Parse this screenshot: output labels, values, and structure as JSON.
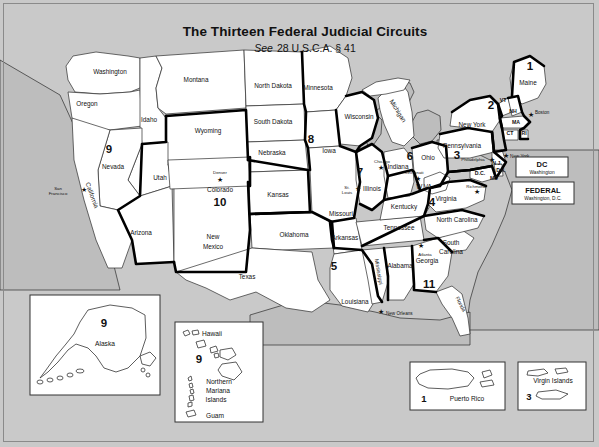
{
  "header": {
    "title": "The Thirteen Federal Judicial Circuits",
    "subtitle_italic": "See",
    "subtitle_rest": "28 U.S.C.A. § 41"
  },
  "colors": {
    "background": "#c9c9c9",
    "land": "#ffffff",
    "water": "#bdbdbd",
    "border": "#2b2b2b",
    "circuit_boundary": "#000000"
  },
  "states": [
    {
      "name": "Washington",
      "x": 110,
      "y": 74
    },
    {
      "name": "Oregon",
      "x": 87,
      "y": 106
    },
    {
      "name": "Idaho",
      "x": 149,
      "y": 122
    },
    {
      "name": "Montana",
      "x": 196,
      "y": 82
    },
    {
      "name": "Wyoming",
      "x": 208,
      "y": 133
    },
    {
      "name": "Nevada",
      "x": 113,
      "y": 169
    },
    {
      "name": "Utah",
      "x": 160,
      "y": 180
    },
    {
      "name": "California",
      "x": 90,
      "y": 196
    },
    {
      "name": "Arizona",
      "x": 141,
      "y": 235
    },
    {
      "name": "New",
      "x": 213,
      "y": 239
    },
    {
      "name": "Mexico",
      "x": 213,
      "y": 249
    },
    {
      "name": "Colorado",
      "x": 220,
      "y": 192
    },
    {
      "name": "North Dakota",
      "x": 273,
      "y": 88
    },
    {
      "name": "South Dakota",
      "x": 273,
      "y": 124
    },
    {
      "name": "Nebraska",
      "x": 272,
      "y": 155
    },
    {
      "name": "Kansas",
      "x": 278,
      "y": 197
    },
    {
      "name": "Oklahoma",
      "x": 294,
      "y": 237
    },
    {
      "name": "Texas",
      "x": 247,
      "y": 279
    },
    {
      "name": "Minnesota",
      "x": 318,
      "y": 90
    },
    {
      "name": "Iowa",
      "x": 329,
      "y": 153
    },
    {
      "name": "Missouri",
      "x": 341,
      "y": 216
    },
    {
      "name": "Arkansas",
      "x": 345,
      "y": 240
    },
    {
      "name": "Louisiana",
      "x": 355,
      "y": 304
    },
    {
      "name": "Wisconsin",
      "x": 359,
      "y": 119
    },
    {
      "name": "Illinois",
      "x": 372,
      "y": 191
    },
    {
      "name": "Mississippi",
      "x": 377,
      "y": 272
    },
    {
      "name": "Alabama",
      "x": 400,
      "y": 268
    },
    {
      "name": "Tennessee",
      "x": 399,
      "y": 230
    },
    {
      "name": "Kentucky",
      "x": 404,
      "y": 209
    },
    {
      "name": "Indiana",
      "x": 398,
      "y": 169
    },
    {
      "name": "Ohio",
      "x": 428,
      "y": 160
    },
    {
      "name": "Michigan",
      "x": 396,
      "y": 112
    },
    {
      "name": "Georgia",
      "x": 427,
      "y": 263
    },
    {
      "name": "Florida",
      "x": 459,
      "y": 305
    },
    {
      "name": "South",
      "x": 451,
      "y": 245
    },
    {
      "name": "Carolina",
      "x": 451,
      "y": 254
    },
    {
      "name": "North Carolina",
      "x": 457,
      "y": 222
    },
    {
      "name": "Virginia",
      "x": 446,
      "y": 201
    },
    {
      "name": "W.VA.",
      "x": 425,
      "y": 189
    },
    {
      "name": "Pennsylvania",
      "x": 462,
      "y": 148
    },
    {
      "name": "New York",
      "x": 472,
      "y": 127
    },
    {
      "name": "Maine",
      "x": 528,
      "y": 85
    }
  ],
  "abbr_states": [
    {
      "name": "VT",
      "x": 503,
      "y": 102
    },
    {
      "name": "NH",
      "x": 513,
      "y": 113
    },
    {
      "name": "MA",
      "x": 516,
      "y": 124
    },
    {
      "name": "CT",
      "x": 510,
      "y": 135
    },
    {
      "name": "RI",
      "x": 524,
      "y": 135
    },
    {
      "name": "N.J.",
      "x": 497,
      "y": 165
    },
    {
      "name": "Del.",
      "x": 501,
      "y": 172
    },
    {
      "name": "MD",
      "x": 494,
      "y": 180
    },
    {
      "name": "D.C.",
      "x": 480,
      "y": 175
    }
  ],
  "circuit_numbers": [
    {
      "label": "1",
      "x": 530,
      "y": 70
    },
    {
      "label": "2",
      "x": 491,
      "y": 109
    },
    {
      "label": "3",
      "x": 457,
      "y": 159
    },
    {
      "label": "4",
      "x": 432,
      "y": 206
    },
    {
      "label": "5",
      "x": 334,
      "y": 270
    },
    {
      "label": "6",
      "x": 410,
      "y": 160
    },
    {
      "label": "7",
      "x": 360,
      "y": 176
    },
    {
      "label": "8",
      "x": 311,
      "y": 143
    },
    {
      "label": "9",
      "x": 109,
      "y": 153
    },
    {
      "label": "10",
      "x": 220,
      "y": 206
    },
    {
      "label": "11",
      "x": 429,
      "y": 288
    }
  ],
  "cities": [
    {
      "name": "San",
      "sub": "Francisco",
      "x": 58,
      "y": 192,
      "star_x": 84,
      "star_y": 190
    },
    {
      "name": "Denver",
      "sub": "",
      "x": 220,
      "y": 173,
      "star_x": 220,
      "star_y": 180
    },
    {
      "name": "St.",
      "sub": "Louis",
      "x": 348,
      "y": 190,
      "star_x": 358,
      "star_y": 190
    },
    {
      "name": "Chicago",
      "sub": "",
      "x": 382,
      "y": 162,
      "star_x": 381,
      "star_y": 168
    },
    {
      "name": "Cincinnati",
      "sub": "",
      "x": 415,
      "y": 172,
      "star_x": 418,
      "star_y": 179
    },
    {
      "name": "Atlanta",
      "sub": "",
      "x": 425,
      "y": 253,
      "star_x": 421,
      "star_y": 247
    },
    {
      "name": "New Orleans",
      "sub": "",
      "x": 392,
      "y": 315,
      "star_x": 381,
      "star_y": 312
    },
    {
      "name": "Boston",
      "sub": "",
      "x": 540,
      "y": 116,
      "star_x": 531,
      "star_y": 115
    },
    {
      "name": "New York",
      "sub": "",
      "x": 516,
      "y": 157,
      "star_x": 506,
      "star_y": 156
    },
    {
      "name": "Philadelphia",
      "sub": "",
      "x": 477,
      "y": 161,
      "star_x": 492,
      "star_y": 160
    },
    {
      "name": "Richmond",
      "sub": "",
      "x": 476,
      "y": 186,
      "star_x": 477,
      "star_y": 193
    }
  ],
  "legend_boxes": [
    {
      "title": "DC",
      "subtitle": "Washington",
      "x": 516,
      "y": 157,
      "w": 52,
      "h": 20
    },
    {
      "title": "FEDERAL",
      "subtitle": "Washington, D.C.",
      "x": 512,
      "y": 182,
      "w": 62,
      "h": 22
    }
  ],
  "insets": [
    {
      "name": "alaska",
      "x": 30,
      "y": 295,
      "w": 130,
      "h": 100,
      "labels": [
        {
          "text": "9",
          "x": 104,
          "y": 324,
          "type": "number"
        },
        {
          "text": "Alaska",
          "x": 105,
          "y": 344,
          "type": "name"
        }
      ]
    },
    {
      "name": "hawaii-pacific",
      "x": 175,
      "y": 322,
      "w": 88,
      "h": 100,
      "labels": [
        {
          "text": "Hawaii",
          "x": 212,
          "y": 334,
          "type": "name"
        },
        {
          "text": "9",
          "x": 199,
          "y": 359,
          "type": "number"
        },
        {
          "text": "Northern",
          "x": 219,
          "y": 382,
          "type": "name"
        },
        {
          "text": "Mariana",
          "x": 218,
          "y": 391,
          "type": "name"
        },
        {
          "text": "Islands",
          "x": 216,
          "y": 400,
          "type": "name"
        },
        {
          "text": "Guam",
          "x": 215,
          "y": 416,
          "type": "name"
        }
      ]
    },
    {
      "name": "puerto-rico",
      "x": 410,
      "y": 362,
      "w": 95,
      "h": 48,
      "labels": [
        {
          "text": "1",
          "x": 424,
          "y": 401,
          "type": "number"
        },
        {
          "text": "Puerto Rico",
          "x": 467,
          "y": 400,
          "type": "name"
        }
      ]
    },
    {
      "name": "virgin-islands",
      "x": 518,
      "y": 362,
      "w": 68,
      "h": 48,
      "labels": [
        {
          "text": "Virgin Islands",
          "x": 553,
          "y": 381,
          "type": "name"
        },
        {
          "text": "3",
          "x": 529,
          "y": 397,
          "type": "number"
        }
      ]
    }
  ]
}
